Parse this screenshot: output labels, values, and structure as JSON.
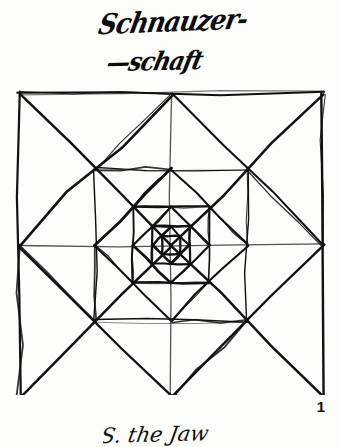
{
  "page": {
    "background_color": "#fdfdfc",
    "ink_color": "#0c0c0c",
    "width": 341,
    "height": 447,
    "page_number": "1"
  },
  "title": {
    "line1": "Schnauzer-",
    "line2": "—schaft"
  },
  "footer": {
    "note": "S. the Jaw"
  },
  "figure": {
    "name": "nested-squares-diamonds-spiral",
    "stroke_color": "#111111",
    "outer_square": {
      "left": 17,
      "top": 13,
      "right": 322,
      "bottom": 297
    },
    "levels": 9,
    "center": {
      "x": 171,
      "y": 155
    },
    "rings": [
      {
        "index": 0,
        "shape": "square",
        "half": 152,
        "rotation": 0,
        "stroke": 2.1
      },
      {
        "index": 1,
        "shape": "diamond",
        "half": 107,
        "rotation": 45,
        "stroke": 2.3
      },
      {
        "index": 2,
        "shape": "square",
        "half": 76,
        "rotation": 0,
        "stroke": 1.5
      },
      {
        "index": 3,
        "shape": "diamond",
        "half": 54,
        "rotation": 45,
        "stroke": 2.4
      },
      {
        "index": 4,
        "shape": "square",
        "half": 38,
        "rotation": 0,
        "stroke": 2.0
      },
      {
        "index": 5,
        "shape": "diamond",
        "half": 27,
        "rotation": 45,
        "stroke": 2.6
      },
      {
        "index": 6,
        "shape": "square",
        "half": 19,
        "rotation": 0,
        "stroke": 2.2
      },
      {
        "index": 7,
        "shape": "diamond",
        "half": 13,
        "rotation": 45,
        "stroke": 2.3
      },
      {
        "index": 8,
        "shape": "square",
        "half": 9,
        "rotation": 0,
        "stroke": 2.0
      }
    ],
    "guides": [
      {
        "name": "diagonal-tl-br"
      },
      {
        "name": "diagonal-tr-bl"
      },
      {
        "name": "midline-horizontal"
      },
      {
        "name": "midline-vertical"
      }
    ]
  }
}
